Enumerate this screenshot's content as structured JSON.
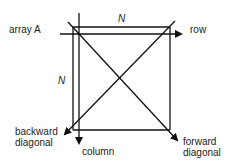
{
  "diagram": {
    "title_label": "array A",
    "top_dimension": "N",
    "left_dimension": "N",
    "arrows": {
      "row": "row",
      "column": "column",
      "backward_diagonal": [
        "backward",
        "diagonal"
      ],
      "forward_diagonal": [
        "forward",
        "diagonal"
      ]
    },
    "colors": {
      "stroke": "#111111",
      "text": "#222222",
      "background": "#ffffff"
    }
  }
}
